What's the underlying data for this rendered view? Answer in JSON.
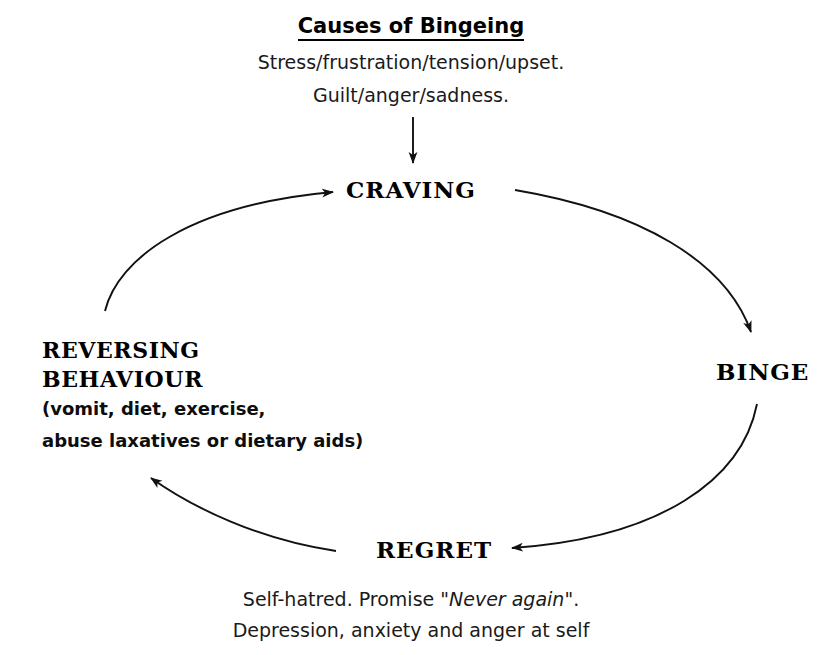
{
  "diagram": {
    "title": "Causes of Bingeing",
    "causes": [
      "Stress/frustration/tension/upset.",
      "Guilt/anger/sadness."
    ],
    "nodes": {
      "craving": "CRAVING",
      "binge": "BINGE",
      "regret": "REGRET",
      "reversing_line1": "REVERSING",
      "reversing_line2": "BEHAVIOUR",
      "reversing_detail_line1": "(vomit, diet, exercise,",
      "reversing_detail_line2": "abuse laxatives or dietary aids)"
    },
    "regret_detail": {
      "line1_prefix": "Self-hatred. Promise \"",
      "line1_emphasis": "Never again",
      "line1_suffix": "\".",
      "line2": "Depression, anxiety and anger at self"
    },
    "arrows": {
      "causes_to_craving": "arrow-down-causes-to-craving",
      "reversing_to_craving": "arrow-reversing-to-craving",
      "craving_to_binge": "arrow-craving-to-binge",
      "binge_to_regret": "arrow-binge-to-regret",
      "regret_to_reversing": "arrow-regret-to-reversing"
    },
    "colors": {
      "ink": "#000000",
      "background": "#ffffff"
    }
  }
}
